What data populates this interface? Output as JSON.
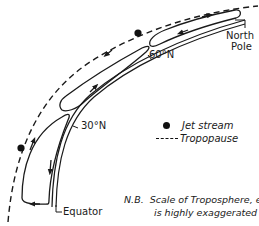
{
  "diagram": {
    "type": "cross-section of atmospheric circulation cells (Northern Hemisphere)",
    "labels": {
      "north_pole": [
        "North",
        "Pole"
      ],
      "equator": "Equator",
      "lat_60": "60°N",
      "lat_30": "30°N"
    },
    "legend": {
      "jet_stream": "Jet stream",
      "tropopause": "Tropopause"
    },
    "note": {
      "prefix": "N.B.",
      "line1": "Scale of Troposphere, etc.,",
      "line2": "is highly exaggerated"
    },
    "elements": {
      "tropopause_line": "dashed",
      "earth_surface": "double line",
      "cells": [
        "Hadley cell (Equator–30°N)",
        "Ferrel cell (30°N–60°N)",
        "Polar cell (60°N–North Pole)"
      ],
      "jet_stream_markers": 2
    },
    "colors": {
      "ink": "#1a1a1a",
      "background": "#ffffff"
    }
  }
}
